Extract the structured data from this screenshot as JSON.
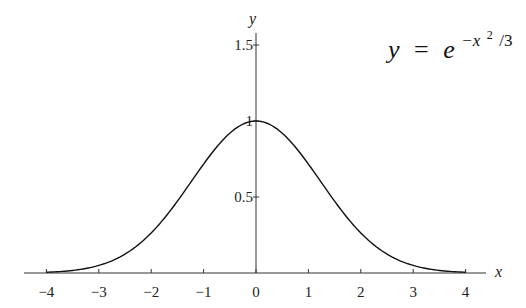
{
  "chart_data": {
    "type": "line",
    "title": "",
    "annotation": {
      "lhs": "y",
      "eq": "=",
      "base": "e",
      "exponent": "−x",
      "exp_power": "2",
      "exp_tail": "/3"
    },
    "xlabel": "x",
    "ylabel": "y",
    "xlim": [
      -4.2,
      4.6
    ],
    "ylim": [
      0,
      1.6
    ],
    "grid": false,
    "legend": "none",
    "x_ticks": [
      -4,
      -3,
      -2,
      -1,
      0,
      1,
      2,
      3,
      4
    ],
    "x_tick_labels": [
      "−4",
      "−3",
      "−2",
      "−1",
      "0",
      "1",
      "2",
      "3",
      "4"
    ],
    "y_ticks": [
      0.5,
      1,
      1.5
    ],
    "y_tick_labels": [
      "0.5",
      "1",
      "1.5"
    ],
    "series": [
      {
        "name": "y = e^(-x^2/3)",
        "function": "exp(-x^2/3)",
        "x": [
          -4,
          -3.5,
          -3,
          -2.5,
          -2,
          -1.5,
          -1,
          -0.5,
          0,
          0.5,
          1,
          1.5,
          2,
          2.5,
          3,
          3.5,
          4
        ],
        "values": [
          0.005,
          0.017,
          0.05,
          0.125,
          0.264,
          0.472,
          0.717,
          0.92,
          1.0,
          0.92,
          0.717,
          0.472,
          0.264,
          0.125,
          0.05,
          0.017,
          0.005
        ]
      }
    ]
  }
}
